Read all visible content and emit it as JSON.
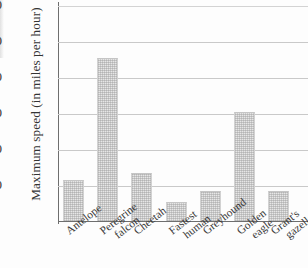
{
  "chart_data": {
    "type": "bar",
    "title": "",
    "subtitle": "",
    "xlabel": "",
    "ylabel": "Maximum speed (in miles per hour)",
    "categories": [
      "Antelope",
      "Peregrine falcon",
      "Cheetah",
      "Fastest human",
      "Greyhound",
      "Golden eagle",
      "Grant's gazelle"
    ],
    "category_lines": [
      [
        "Antelope"
      ],
      [
        "Peregrine",
        "falcon"
      ],
      [
        "Cheetah"
      ],
      [
        "Fastest",
        "human"
      ],
      [
        "Greyhound"
      ],
      [
        "Golden",
        "eagle"
      ],
      [
        "Grant's",
        "gazelle"
      ]
    ],
    "values": [
      55,
      225,
      65,
      25,
      40,
      150,
      40
    ],
    "ylim": [
      0,
      300
    ],
    "yticks": [
      50,
      100,
      150,
      200,
      250,
      300
    ],
    "ytick_labels": [
      "50",
      "100",
      "150",
      "200",
      "250",
      "300"
    ],
    "grid": true,
    "grid_axis": "y",
    "legend": false,
    "bar_color": "#e6e6e6",
    "grid_color": "#c9c9c9",
    "axis_color": "#6e6e6e",
    "text_color": "#343434"
  }
}
